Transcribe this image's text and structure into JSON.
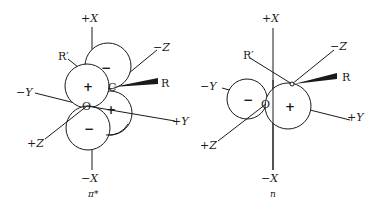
{
  "figure": {
    "panels": [
      {
        "id": "pi-star",
        "caption": "π*",
        "axes": {
          "plus_x": "+X",
          "minus_x": "−X",
          "plus_y": "+Y",
          "minus_y": "−Y",
          "plus_z": "+Z",
          "minus_z": "−Z"
        },
        "atoms": {
          "oxygen": "O",
          "carbon": "C"
        },
        "substituents": {
          "r": "R",
          "r_prime": "R′"
        },
        "lobes": [
          {
            "position": "upper-left",
            "sign": "+"
          },
          {
            "position": "upper-right",
            "sign": "−"
          },
          {
            "position": "lower-left",
            "sign": "−"
          },
          {
            "position": "lower-right",
            "sign": "+"
          }
        ]
      },
      {
        "id": "n",
        "caption": "n",
        "axes": {
          "plus_x": "+X",
          "minus_x": "−X",
          "plus_y": "+Y",
          "minus_y": "−Y",
          "plus_z": "+Z",
          "minus_z": "−Z"
        },
        "atoms": {
          "oxygen": "O",
          "carbon": "C"
        },
        "substituents": {
          "r": "R",
          "r_prime": "R′"
        },
        "lobes": [
          {
            "position": "left",
            "sign": "−"
          },
          {
            "position": "right",
            "sign": "+"
          }
        ]
      }
    ]
  }
}
